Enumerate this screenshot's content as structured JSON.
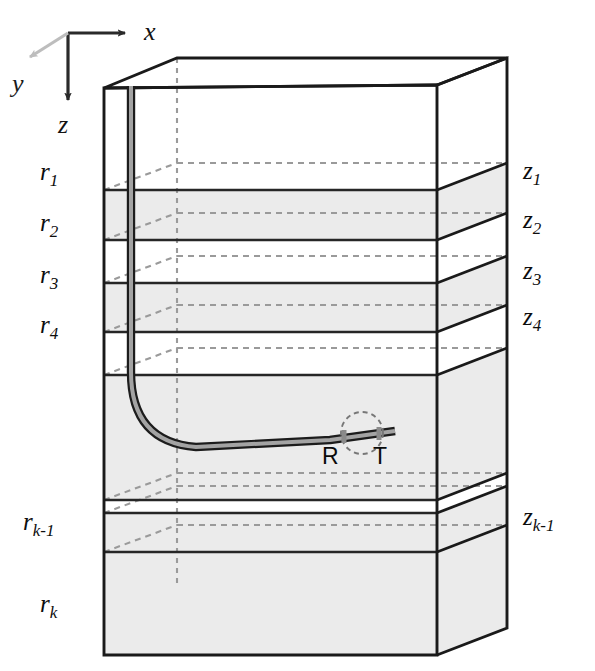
{
  "figure": {
    "background_color": "#ffffff",
    "line_color": "#1a1a1a",
    "dashed_color": "#9a9a9a",
    "shade_color": "#ebebeb",
    "well_color": "#a8a8a8",
    "axis_y_color": "#b5b5b5"
  },
  "axes": {
    "x_label": "x",
    "y_label": "y",
    "z_label": "z"
  },
  "layers_left": [
    {
      "id": "r1",
      "base": "r",
      "sub": "1"
    },
    {
      "id": "r2",
      "base": "r",
      "sub": "2"
    },
    {
      "id": "r3",
      "base": "r",
      "sub": "3"
    },
    {
      "id": "r4",
      "base": "r",
      "sub": "4"
    },
    {
      "id": "rk1",
      "base": "r",
      "sub": "k-1"
    },
    {
      "id": "rk",
      "base": "r",
      "sub": "k"
    }
  ],
  "depths_right": [
    {
      "id": "z1",
      "base": "z",
      "sub": "1"
    },
    {
      "id": "z2",
      "base": "z",
      "sub": "2"
    },
    {
      "id": "z3",
      "base": "z",
      "sub": "3"
    },
    {
      "id": "z4",
      "base": "z",
      "sub": "4"
    },
    {
      "id": "zk1",
      "base": "z",
      "sub": "k-1"
    }
  ],
  "well_markers": {
    "receiver_label": "R",
    "transmitter_label": "T"
  },
  "label_text": {
    "r1": "r",
    "r1s": "1",
    "r2": "r",
    "r2s": "2",
    "r3": "r",
    "r3s": "3",
    "r4": "r",
    "r4s": "4",
    "rk1": "r",
    "rk1s": "k-1",
    "rk": "r",
    "rks": "k",
    "z1": "z",
    "z1s": "1",
    "z2": "z",
    "z2s": "2",
    "z3": "z",
    "z3s": "3",
    "z4": "z",
    "z4s": "4",
    "zk1": "z",
    "zk1s": "k-1"
  }
}
